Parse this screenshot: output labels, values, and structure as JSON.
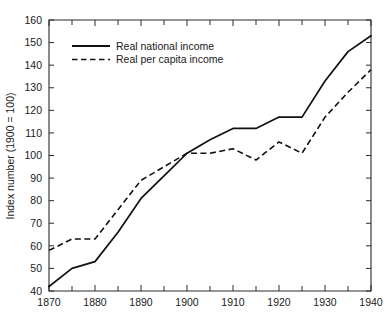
{
  "chart_data": {
    "type": "line",
    "title": "",
    "xlabel": "",
    "ylabel": "Index number (1900 = 100)",
    "xlim": [
      1870,
      1940
    ],
    "ylim": [
      40,
      160
    ],
    "grid": false,
    "legend_position": "upper-left-inside",
    "x_major_ticks": [
      1870,
      1880,
      1890,
      1900,
      1910,
      1920,
      1930,
      1940
    ],
    "x_major_tick_labels": [
      "1870",
      "1880",
      "1890",
      "1900",
      "1910",
      "1920",
      "1930",
      "1940"
    ],
    "x_minor_ticks": [
      1875,
      1885,
      1895,
      1905,
      1915,
      1925,
      1935
    ],
    "y_major_ticks": [
      40,
      50,
      60,
      70,
      80,
      90,
      100,
      110,
      120,
      130,
      140,
      150,
      160
    ],
    "y_major_tick_labels": [
      "40",
      "50",
      "60",
      "70",
      "80",
      "90",
      "100",
      "110",
      "120",
      "130",
      "140",
      "150",
      "160"
    ],
    "x": [
      1870,
      1875,
      1880,
      1885,
      1890,
      1895,
      1900,
      1905,
      1910,
      1915,
      1920,
      1925,
      1930,
      1935,
      1940
    ],
    "series": [
      {
        "name": "Real national income",
        "style": "solid",
        "values": [
          42,
          50,
          53,
          66,
          81,
          91,
          101,
          107,
          112,
          112,
          117,
          117,
          133,
          146,
          153
        ]
      },
      {
        "name": "Real per capita income",
        "style": "dashed",
        "values": [
          58,
          63,
          63,
          76,
          89,
          95,
          101,
          101,
          103,
          98,
          106,
          101,
          117,
          128,
          138
        ]
      }
    ]
  },
  "legend": {
    "entries": [
      {
        "label": "Real national income",
        "style": "solid"
      },
      {
        "label": "Real per capita income",
        "style": "dashed"
      }
    ]
  },
  "colors": {
    "line": "#111111",
    "axis": "#2b2b2b",
    "background": "#ffffff",
    "text": "#1a1a1a"
  }
}
